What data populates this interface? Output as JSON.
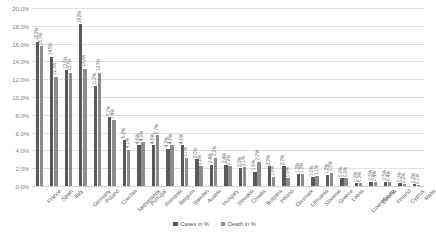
{
  "chart_data": {
    "type": "bar",
    "title": "",
    "xlabel": "",
    "ylabel": "",
    "ylim": [
      0,
      0.2
    ],
    "grid": true,
    "legend_position": "bottom",
    "ytick_labels": [
      "20.0%",
      "18.0%",
      "16.0%",
      "14.0%",
      "12.0%",
      "10.0%",
      "8.0%",
      "6.0%",
      "4.0%",
      "2.0%",
      "0.0%"
    ],
    "ytick_values": [
      20.0,
      18.0,
      16.0,
      14.0,
      12.0,
      10.0,
      8.0,
      6.0,
      4.0,
      2.0,
      0.0
    ],
    "categories": [
      "France",
      "Spain",
      "Italy",
      "Germany",
      "Poland",
      "Czechia",
      "Netherlands",
      "Portugal",
      "Romania",
      "Belgium",
      "Sweden",
      "Austria",
      "Hungary",
      "Slovakia",
      "Croatia",
      "Bulgaria",
      "Ireland",
      "Denmark",
      "Lithuania",
      "Slovenia",
      "Greece",
      "Latvia",
      "Luxembourg",
      "Estonia",
      "Finland",
      "Cyprus",
      "Malta"
    ],
    "series": [
      {
        "name": "Cases in %",
        "color": "#595959",
        "values": [
          16.2,
          14.5,
          13.0,
          18.2,
          11.2,
          7.7,
          5.2,
          4.6,
          4.6,
          4.2,
          4.6,
          3.0,
          2.4,
          2.4,
          2.0,
          1.6,
          2.2,
          2.2,
          1.3,
          1.0,
          1.2,
          0.9,
          0.3,
          0.5,
          0.5,
          0.3,
          0.2
        ],
        "labels": [
          "16.2%",
          "14.5%",
          "13.0%",
          "18.2%",
          "11.2%",
          "7.7%",
          "5.2%",
          "4.6%",
          "4.6%",
          "4.2%",
          "4.6%",
          "3.0%",
          "2.4%",
          "2.4%",
          "2.0%",
          "1.6%",
          "2.2%",
          "2.2%",
          "1.3%",
          "1.0%",
          "1.2%",
          "0.9%",
          "0.3%",
          "0.5%",
          "0.5%",
          "0.3%",
          "0.2%"
        ]
      },
      {
        "name": "Death in %",
        "color": "#8c8c8c",
        "values": [
          15.7,
          12.3,
          12.7,
          13.2,
          12.7,
          7.4,
          4.1,
          4.9,
          5.7,
          4.6,
          3.1,
          2.2,
          3.2,
          2.2,
          2.1,
          2.7,
          1.0,
          0.9,
          1.3,
          1.1,
          1.5,
          0.9,
          0.3,
          0.4,
          0.4,
          0.2,
          0.1
        ],
        "labels": [
          "15.7%",
          "12.3%",
          "12.7%",
          "13.2%",
          "12.7%",
          "7.4%",
          "4.1%",
          "4.9%",
          "5.7%",
          "4.6%",
          "3.1%",
          "2.2%",
          "3.2%",
          "2.2%",
          "2.1%",
          "2.7%",
          "1.0%",
          "0.9%",
          "1.3%",
          "1.1%",
          "1.5%",
          "0.9%",
          "0.3%",
          "0.4%",
          "0.4%",
          "0.2%",
          "0.1%"
        ]
      }
    ]
  }
}
